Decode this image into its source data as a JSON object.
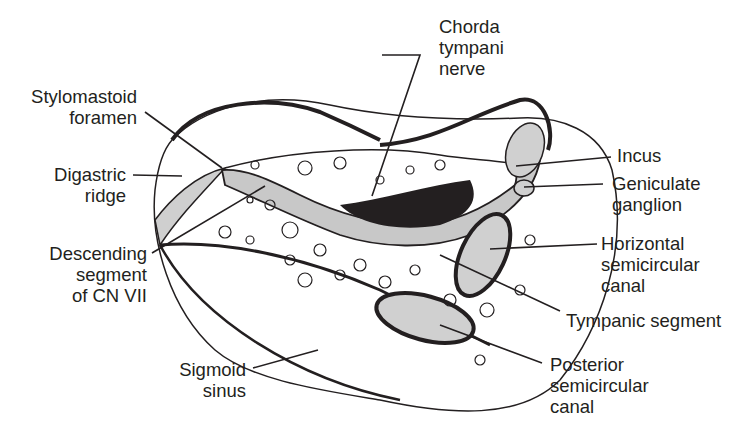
{
  "figure": {
    "labels": {
      "chorda": [
        "Chorda",
        "tympani",
        "nerve"
      ],
      "stylomastoid": [
        "Stylomastoid",
        "foramen"
      ],
      "digastric": [
        "Digastric",
        "ridge"
      ],
      "descending": [
        "Descending",
        "segment",
        "of CN VII"
      ],
      "sigmoid": [
        "Sigmoid",
        "sinus"
      ],
      "incus": [
        "Incus"
      ],
      "geniculate": [
        "Geniculate",
        "ganglion"
      ],
      "horizontal": [
        "Horizontal",
        "semicircular",
        "canal"
      ],
      "tympanic": [
        "Tympanic segment"
      ],
      "posterior": [
        "Posterior",
        "semicircular",
        "canal"
      ]
    },
    "colors": {
      "ink": "#231f20",
      "nerve_fill": "#c8c8c8",
      "background": "#ffffff"
    }
  }
}
